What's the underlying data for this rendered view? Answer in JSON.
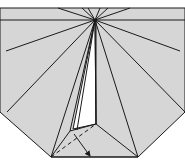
{
  "diagram": {
    "type": "origami-fold-step",
    "colors": {
      "background": "#ffffff",
      "paper": "#d6d6d6",
      "flap": "#ffffff",
      "line": "#1a1a1a"
    },
    "paper_polygon": "0,8 185,8 185,112 138,157 51,157 0,112",
    "apex": [
      95,
      20
    ],
    "horizontal_crease": [
      0,
      20,
      185,
      20
    ],
    "rays": [
      [
        95,
        20,
        58,
        8
      ],
      [
        95,
        20,
        82,
        8
      ],
      [
        95,
        20,
        88,
        8
      ],
      [
        95,
        20,
        100,
        8
      ],
      [
        95,
        20,
        108,
        8
      ],
      [
        95,
        20,
        130,
        8
      ],
      [
        95,
        20,
        6,
        51
      ],
      [
        95,
        20,
        180,
        51
      ],
      [
        95,
        20,
        7,
        112
      ],
      [
        95,
        20,
        185,
        112
      ],
      [
        95,
        20,
        51,
        157
      ],
      [
        95,
        20,
        138,
        157
      ],
      [
        95,
        20,
        70,
        131
      ],
      [
        95,
        20,
        96,
        124
      ],
      [
        95,
        20,
        77,
        130
      ]
    ],
    "white_flap_polygon": "95,20 73,129 96,124",
    "flap_lines": [
      [
        70,
        131,
        96,
        124
      ],
      [
        96,
        124,
        138,
        157
      ],
      [
        70,
        131,
        51,
        157
      ],
      [
        51,
        157,
        138,
        157
      ],
      [
        96,
        124,
        96,
        20
      ]
    ],
    "dashed_line": [
      51,
      157,
      96,
      124
    ],
    "arrow": {
      "from": [
        74,
        134
      ],
      "to": [
        90,
        156
      ]
    }
  }
}
